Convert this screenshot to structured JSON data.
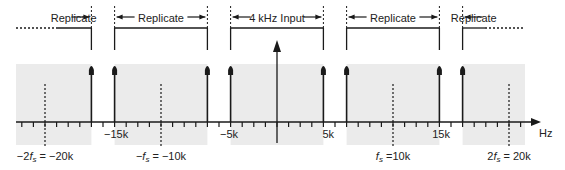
{
  "axis": {
    "unit_label": "Hz",
    "min_khz": -23,
    "max_khz": 23,
    "tick_step_khz": 1
  },
  "colors": {
    "band": "#ebebeb",
    "ink": "#1a1a1a"
  },
  "bands": [
    {
      "label": "Replicate",
      "from_khz": -23,
      "to_khz": -16,
      "open_left": true
    },
    {
      "label": "Replicate",
      "from_khz": -14,
      "to_khz": -6
    },
    {
      "label": "4 kHz Input",
      "from_khz": -4,
      "to_khz": 4
    },
    {
      "label": "Replicate",
      "from_khz": 6,
      "to_khz": 14
    },
    {
      "label": "Replicate",
      "from_khz": 16,
      "to_khz": 23,
      "open_right": true
    }
  ],
  "spikes_khz": [
    -16,
    -14,
    -6,
    -4,
    4,
    6,
    14,
    16
  ],
  "tick_labels": [
    {
      "text": "−15k",
      "at_khz": -15
    },
    {
      "text": "−5k",
      "at_khz": -5
    },
    {
      "text": "5k",
      "at_khz": 5
    },
    {
      "text": "15k",
      "at_khz": 15
    }
  ],
  "sample_markers": [
    {
      "at_khz": -20,
      "prefix": "−2",
      "sym": "f",
      "sub": "s",
      "suffix": " = −20k"
    },
    {
      "at_khz": -10,
      "prefix": "−",
      "sym": "f",
      "sub": "s",
      "suffix": " = −10k"
    },
    {
      "at_khz": 10,
      "prefix": "",
      "sym": "f",
      "sub": "s",
      "suffix": " =10k"
    },
    {
      "at_khz": 20,
      "prefix": "2",
      "sym": "f",
      "sub": "s",
      "suffix": " = 20k"
    }
  ]
}
